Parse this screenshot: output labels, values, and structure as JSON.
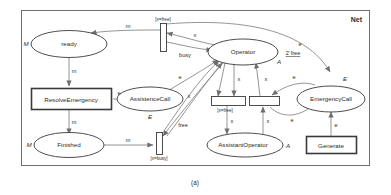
{
  "figure": {
    "caption": "(a)",
    "net_label": "Net"
  },
  "places": [
    {
      "id": "ready",
      "label": "ready",
      "type": "M",
      "type_pos": "left"
    },
    {
      "id": "finished",
      "label": "Finished",
      "type": "M",
      "type_pos": "left"
    },
    {
      "id": "assistencecall",
      "label": "AssistenceCall",
      "type": "E",
      "type_pos": "below"
    },
    {
      "id": "operator",
      "label": "Operator",
      "type": "A",
      "type_pos": "below-right",
      "marking": "2`free"
    },
    {
      "id": "assistantoperator",
      "label": "AssistantOperator",
      "type": "A",
      "type_pos": "right"
    },
    {
      "id": "emergencycall",
      "label": "EmergencyCall",
      "type": "E",
      "type_pos": "above-right"
    }
  ],
  "transitions": [
    {
      "id": "t_xfree_top",
      "label": "",
      "guard": "[x=free]"
    },
    {
      "id": "t_xbusy",
      "label": "",
      "guard": "[x=busy]"
    },
    {
      "id": "t_xfree_mid",
      "label": "",
      "guard": "[x=free]"
    },
    {
      "id": "t_plain_mid",
      "label": "",
      "guard": ""
    },
    {
      "id": "t_resolve",
      "label": "ResolveEmergency",
      "guard": ""
    },
    {
      "id": "t_generate",
      "label": "Generate",
      "guard": ""
    }
  ],
  "arc_labels": {
    "m_top": "m",
    "m_ready_res": "m",
    "m_res_fin": "m",
    "m_fin_xbusy": "m",
    "e_res_asst": "e",
    "e_asst_up": "e",
    "x_top": "x",
    "busy": "busy",
    "x_free_arc": "free",
    "x_left_up": "x",
    "x_op_mid_l": "x",
    "x_op_mid_r": "x",
    "x_mid_down": "x",
    "x_mid_up": "x",
    "e_right_up": "e",
    "e_right_dn": "e",
    "e_outer_top": "e",
    "e_gen": "e"
  }
}
